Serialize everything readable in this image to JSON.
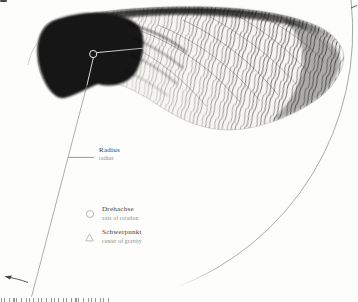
{
  "figure": {
    "subject_icon": "maple-samara-wing-illustration",
    "marker_icons": [
      "axis-circle-marker",
      "gravity-triangle-marker"
    ],
    "colors": {
      "ink": "#161616",
      "leader_line": "#8b8b8b",
      "arc_line": "#979797",
      "label_text": "#3f3d3a",
      "sublabel_text": "#8b8884",
      "background": "#fdfdfb"
    }
  },
  "legend": {
    "radius": {
      "label": "Radius",
      "sublabel": "radius"
    },
    "axis": {
      "label": "Drehachse",
      "sublabel": "axis of rotation",
      "symbol": "circle-icon"
    },
    "gravity": {
      "label": "Schwerpunkt",
      "sublabel": "center of gravity",
      "symbol": "triangle-icon"
    }
  }
}
